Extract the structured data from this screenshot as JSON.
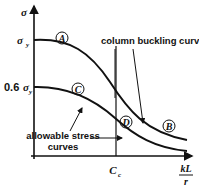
{
  "diagram": {
    "axes": {
      "y_label": "σ",
      "y_ticks": [
        {
          "label": "σ",
          "sub": "y",
          "prefix": ""
        },
        {
          "label": "σ",
          "sub": "y",
          "prefix": "0.6 "
        }
      ],
      "x_label_num": "kL",
      "x_label_den": "r",
      "x_tick": {
        "label": "C",
        "sub": "c"
      }
    },
    "curve_markers": {
      "A": "A",
      "B": "B",
      "C": "C",
      "D": "D"
    },
    "annotations": {
      "column_buckling": "column buckling curves",
      "allowable_line1": "allowable stress",
      "allowable_line2": "curves"
    },
    "colors": {
      "ink": "#111111",
      "background": "#ffffff"
    }
  }
}
